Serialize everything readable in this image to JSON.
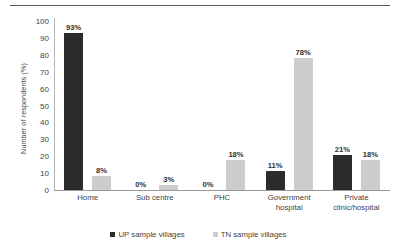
{
  "chart_data": {
    "type": "bar",
    "title": "",
    "xlabel": "",
    "ylabel": "Number of respondents (%)",
    "ylim": [
      0,
      100
    ],
    "ytick_step": 10,
    "yticks": [
      "100",
      "90",
      "80",
      "70",
      "60",
      "50",
      "40",
      "30",
      "20",
      "10",
      "0"
    ],
    "grid": false,
    "legend_position": "bottom",
    "categories": [
      "Home",
      "Sub centre",
      "PHC",
      "Government hospital",
      "Private clinic/hospital"
    ],
    "category_lines": [
      [
        "Home"
      ],
      [
        "Sub centre"
      ],
      [
        "PHC"
      ],
      [
        "Government",
        "hospital"
      ],
      [
        "Private",
        "clinic/hospital"
      ]
    ],
    "series": [
      {
        "name": "UP sample villages",
        "color": "#2b2b2b",
        "values": [
          93,
          0,
          0,
          11,
          21
        ],
        "data_labels": [
          "93%",
          "0%",
          "0%",
          "11%",
          "21%"
        ]
      },
      {
        "name": "TN sample villages",
        "color": "#cdcdcd",
        "values": [
          8,
          3,
          18,
          78,
          18
        ],
        "data_labels": [
          "8%",
          "3%",
          "18%",
          "78%",
          "18%"
        ]
      }
    ]
  },
  "colors": {
    "series_up": "#2b2b2b",
    "series_tn": "#cdcdcd",
    "axis": "#9a9a9a",
    "text": "#3f3f3f",
    "rule": "#5a5a5a"
  }
}
